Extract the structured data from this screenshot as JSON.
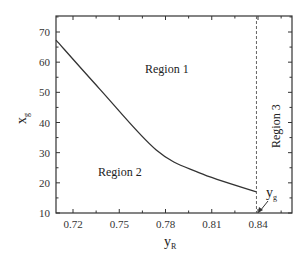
{
  "chart_data": {
    "type": "line",
    "title": "",
    "xlabel": "y_R",
    "ylabel": "x_g",
    "xlim": [
      0.709,
      0.862
    ],
    "ylim": [
      10,
      75
    ],
    "xticks": [
      0.72,
      0.75,
      0.78,
      0.81,
      0.84
    ],
    "xtick_labels": [
      "0.72",
      "0.75",
      "0.78",
      "0.81",
      "0.84"
    ],
    "yticks": [
      10,
      20,
      30,
      40,
      50,
      60,
      70
    ],
    "ytick_labels": [
      "10",
      "20",
      "30",
      "40",
      "50",
      "60",
      "70"
    ],
    "grid": false,
    "legend": null,
    "series": [
      {
        "name": "boundary curve",
        "x": [
          0.709,
          0.7375,
          0.774,
          0.802,
          0.839
        ],
        "y": [
          67.3,
          51.0,
          30.9,
          23.3,
          17.0
        ]
      }
    ],
    "vertical_line": {
      "x": 0.839,
      "style": "dashed"
    },
    "annotations": [
      {
        "text": "Region 1",
        "x": 0.775,
        "y": 56
      },
      {
        "text": "Region 2",
        "x": 0.752,
        "y": 23
      },
      {
        "text": "Region 3",
        "x": 0.851,
        "y": 40,
        "rotation": -90
      },
      {
        "text": "y_g",
        "x": 0.845,
        "y": 14,
        "arrow_to": [
          0.839,
          10
        ]
      }
    ]
  },
  "labels": {
    "region1": "Region 1",
    "region2": "Region 2",
    "region3": "Region 3",
    "yg_main": "y",
    "yg_sub": "g",
    "xlabel_main": "y",
    "xlabel_sub": "R",
    "ylabel_main": "x",
    "ylabel_sub": "g"
  },
  "colors": {
    "axis": "#333333",
    "curve": "#333333",
    "dashed": "#555555"
  }
}
